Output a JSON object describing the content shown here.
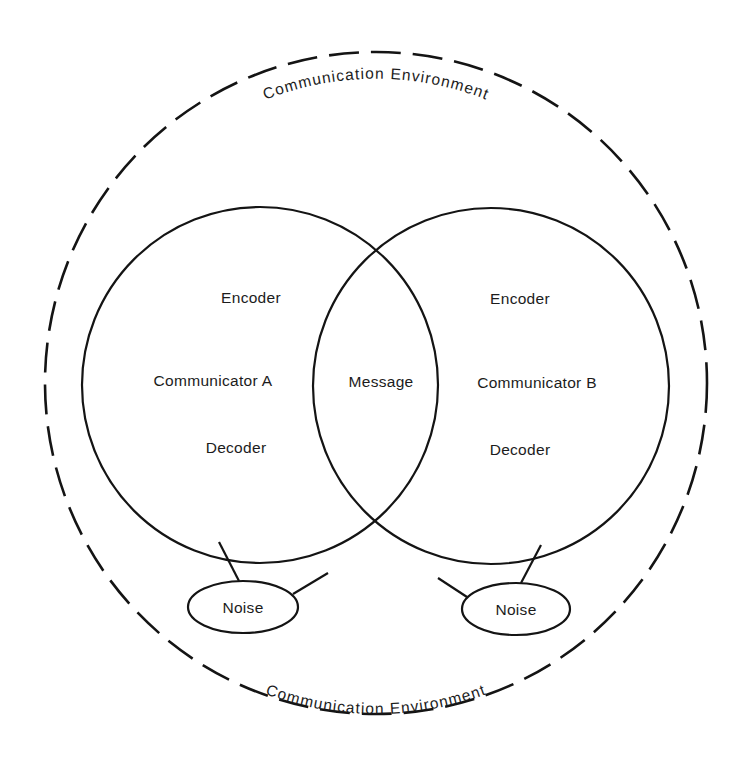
{
  "diagram": {
    "environment": {
      "top_label": "Communication Environment",
      "bottom_label": "Communication Environment",
      "center": [
        376,
        383
      ],
      "radius": 330,
      "style": "dashed"
    },
    "communicator_a": {
      "circle": {
        "cx": 260,
        "cy": 385,
        "r": 178
      },
      "encoder": "Encoder",
      "name": "Communicator A",
      "decoder": "Decoder"
    },
    "communicator_b": {
      "circle": {
        "cx": 491,
        "cy": 386,
        "r": 178
      },
      "encoder": "Encoder",
      "name": "Communicator B",
      "decoder": "Decoder"
    },
    "overlap": {
      "label": "Message"
    },
    "noise_left": {
      "label": "Noise",
      "ellipse": {
        "cx": 243,
        "cy": 607,
        "rx": 55,
        "ry": 26
      }
    },
    "noise_right": {
      "label": "Noise",
      "ellipse": {
        "cx": 516,
        "cy": 609,
        "rx": 54,
        "ry": 26
      }
    },
    "colors": {
      "ink": "#141414",
      "background": "#ffffff"
    }
  }
}
